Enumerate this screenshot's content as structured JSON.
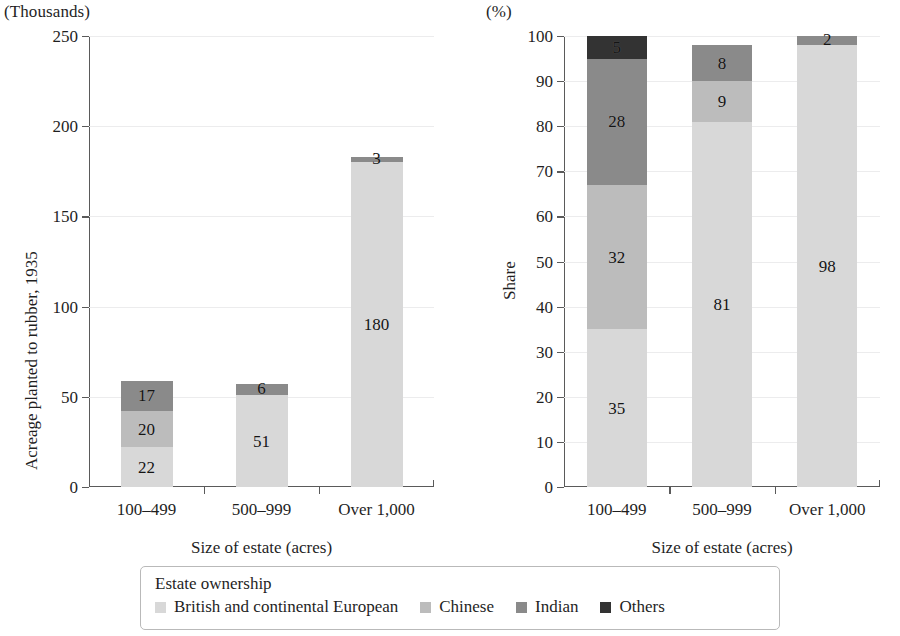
{
  "left_panel": {
    "unit_label": "(Thousands)",
    "y_title": "Acreage planted to rubber, 1935",
    "x_title": "Size of estate (acres)"
  },
  "right_panel": {
    "unit_label": "(%)",
    "y_title": "Share",
    "x_title": "Size of estate (acres)"
  },
  "legend": {
    "title": "Estate ownership",
    "items": [
      {
        "label": "British and continental European",
        "color": "#d8d8d8"
      },
      {
        "label": "Chinese",
        "color": "#bcbcbc"
      },
      {
        "label": "Indian",
        "color": "#8a8a8a"
      },
      {
        "label": "Others",
        "color": "#333333"
      }
    ]
  },
  "colors": {
    "british": "#d8d8d8",
    "chinese": "#bcbcbc",
    "indian": "#8a8a8a",
    "others": "#333333",
    "axis": "#5a5a5a",
    "grid": "#ececed",
    "text": "#1f1f1f"
  },
  "chart_data": [
    {
      "type": "bar",
      "stacked": true,
      "title": "",
      "xlabel": "Size of estate (acres)",
      "ylabel": "Acreage planted to rubber, 1935",
      "unit": "(Thousands)",
      "categories": [
        "100–499",
        "500–999",
        "Over 1,000"
      ],
      "ylim": [
        0,
        250
      ],
      "yticks": [
        0,
        50,
        100,
        150,
        200,
        250
      ],
      "grid": true,
      "legend_position": "bottom",
      "series": [
        {
          "name": "British and continental European",
          "color": "#d8d8d8",
          "values": [
            22,
            51,
            180
          ]
        },
        {
          "name": "Chinese",
          "color": "#bcbcbc",
          "values": [
            20,
            0,
            0
          ]
        },
        {
          "name": "Indian",
          "color": "#8a8a8a",
          "values": [
            17,
            6,
            3
          ]
        },
        {
          "name": "Others",
          "color": "#333333",
          "values": [
            0,
            0,
            0
          ]
        }
      ],
      "totals": [
        59,
        57,
        183
      ]
    },
    {
      "type": "bar",
      "stacked": true,
      "title": "",
      "xlabel": "Size of estate (acres)",
      "ylabel": "Share",
      "unit": "(%)",
      "categories": [
        "100–499",
        "500–999",
        "Over 1,000"
      ],
      "ylim": [
        0,
        100
      ],
      "yticks": [
        0,
        10,
        20,
        30,
        40,
        50,
        60,
        70,
        80,
        90,
        100
      ],
      "grid": true,
      "legend_position": "bottom",
      "series": [
        {
          "name": "British and continental European",
          "color": "#d8d8d8",
          "values": [
            35,
            81,
            98
          ]
        },
        {
          "name": "Chinese",
          "color": "#bcbcbc",
          "values": [
            32,
            9,
            0
          ]
        },
        {
          "name": "Indian",
          "color": "#8a8a8a",
          "values": [
            28,
            8,
            2
          ]
        },
        {
          "name": "Others",
          "color": "#333333",
          "values": [
            5,
            0,
            0
          ]
        }
      ],
      "totals": [
        100,
        98,
        100
      ]
    }
  ]
}
